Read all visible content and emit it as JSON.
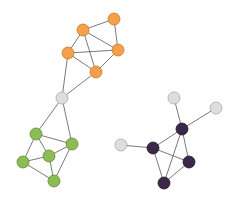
{
  "diagram": {
    "type": "network-graph",
    "colors": {
      "orange": "#f3a04b",
      "orange_stroke": "#c97a2a",
      "green": "#8bbd54",
      "green_stroke": "#5f8a35",
      "purple": "#3b2748",
      "purple_stroke": "#24172d",
      "grey": "#dedede",
      "grey_stroke": "#a8a8a8",
      "edge": "#6b6b6b"
    },
    "node_radius": 6,
    "nodes": [
      {
        "id": "O1",
        "group": "orange",
        "x": 114,
        "y": 19
      },
      {
        "id": "O2",
        "group": "orange",
        "x": 83,
        "y": 30
      },
      {
        "id": "O3",
        "group": "orange",
        "x": 68,
        "y": 53
      },
      {
        "id": "O4",
        "group": "orange",
        "x": 118,
        "y": 50
      },
      {
        "id": "O5",
        "group": "orange",
        "x": 96,
        "y": 72
      },
      {
        "id": "H",
        "group": "grey",
        "x": 62,
        "y": 98
      },
      {
        "id": "G1",
        "group": "green",
        "x": 36,
        "y": 134
      },
      {
        "id": "G2",
        "group": "green",
        "x": 72,
        "y": 144
      },
      {
        "id": "G3",
        "group": "green",
        "x": 49,
        "y": 156
      },
      {
        "id": "G4",
        "group": "green",
        "x": 23,
        "y": 162
      },
      {
        "id": "G5",
        "group": "green",
        "x": 54,
        "y": 181
      },
      {
        "id": "A",
        "group": "grey",
        "x": 174,
        "y": 98
      },
      {
        "id": "B",
        "group": "grey",
        "x": 216,
        "y": 108
      },
      {
        "id": "C",
        "group": "grey",
        "x": 121,
        "y": 145
      },
      {
        "id": "P1",
        "group": "purple",
        "x": 182,
        "y": 129
      },
      {
        "id": "P2",
        "group": "purple",
        "x": 153,
        "y": 148
      },
      {
        "id": "P3",
        "group": "purple",
        "x": 189,
        "y": 162
      },
      {
        "id": "P4",
        "group": "purple",
        "x": 164,
        "y": 183
      }
    ],
    "edges": [
      [
        "O2",
        "O1"
      ],
      [
        "O1",
        "O4"
      ],
      [
        "O2",
        "O4"
      ],
      [
        "O2",
        "O3"
      ],
      [
        "O2",
        "O5"
      ],
      [
        "O3",
        "O4"
      ],
      [
        "O3",
        "O5"
      ],
      [
        "O4",
        "O5"
      ],
      [
        "O3",
        "H"
      ],
      [
        "O5",
        "H"
      ],
      [
        "H",
        "G1"
      ],
      [
        "H",
        "G2"
      ],
      [
        "G1",
        "G2"
      ],
      [
        "G1",
        "G3"
      ],
      [
        "G1",
        "G4"
      ],
      [
        "G2",
        "G3"
      ],
      [
        "G2",
        "G5"
      ],
      [
        "G3",
        "G4"
      ],
      [
        "G3",
        "G5"
      ],
      [
        "G4",
        "G5"
      ],
      [
        "A",
        "P1"
      ],
      [
        "B",
        "P1"
      ],
      [
        "C",
        "P2"
      ],
      [
        "P1",
        "P2"
      ],
      [
        "P1",
        "P3"
      ],
      [
        "P1",
        "P4"
      ],
      [
        "P2",
        "P3"
      ],
      [
        "P2",
        "P4"
      ],
      [
        "P3",
        "P4"
      ]
    ]
  }
}
